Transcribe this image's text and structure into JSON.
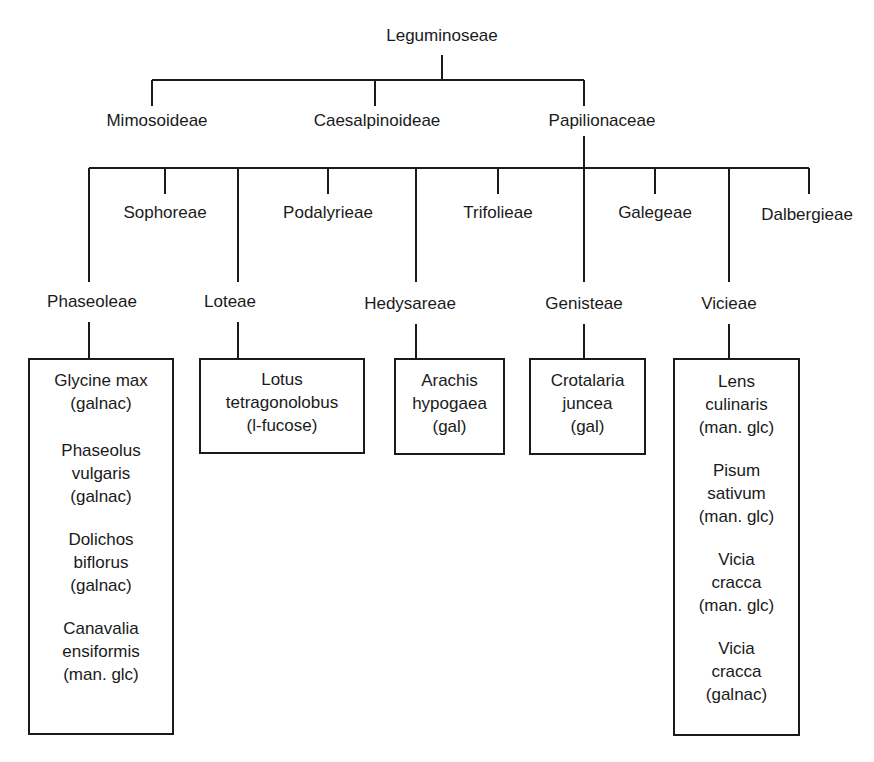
{
  "diagram": {
    "root": {
      "id": "leguminoseae",
      "label": "Leguminoseae"
    },
    "subfamilies": [
      {
        "id": "mimosoideae",
        "label": "Mimosoideae"
      },
      {
        "id": "caesalpinoideae",
        "label": "Caesalpinoideae"
      },
      {
        "id": "papilionaceae",
        "label": "Papilionaceae"
      }
    ],
    "tribes": [
      {
        "id": "phaseoleae",
        "label": "Phaseoleae",
        "row": "lower"
      },
      {
        "id": "sophoreae",
        "label": "Sophoreae",
        "row": "upper"
      },
      {
        "id": "loteae",
        "label": "Loteae",
        "row": "lower"
      },
      {
        "id": "podalyrieae",
        "label": "Podalyrieae",
        "row": "upper"
      },
      {
        "id": "hedysareae",
        "label": "Hedysareae",
        "row": "lower"
      },
      {
        "id": "trifolieae",
        "label": "Trifolieae",
        "row": "upper"
      },
      {
        "id": "genisteae",
        "label": "Genisteae",
        "row": "lower"
      },
      {
        "id": "galegeae",
        "label": "Galegeae",
        "row": "upper"
      },
      {
        "id": "vicieae",
        "label": "Vicieae",
        "row": "lower"
      },
      {
        "id": "dalbergieae",
        "label": "Dalbergieae",
        "row": "upper"
      }
    ],
    "species_boxes": [
      {
        "tribe": "phaseoleae",
        "species": [
          {
            "lines": [
              "Glycine max",
              "(galnac)"
            ]
          },
          {
            "lines": [
              "Phaseolus",
              "vulgaris",
              "(galnac)"
            ]
          },
          {
            "lines": [
              "Dolichos",
              "biflorus",
              "(galnac)"
            ]
          },
          {
            "lines": [
              "Canavalia",
              "ensiformis",
              "(man. glc)"
            ]
          }
        ]
      },
      {
        "tribe": "loteae",
        "species": [
          {
            "lines": [
              "Lotus",
              "tetragonolobus",
              "(l-fucose)"
            ]
          }
        ]
      },
      {
        "tribe": "hedysareae",
        "species": [
          {
            "lines": [
              "Arachis",
              "hypogaea",
              "(gal)"
            ]
          }
        ]
      },
      {
        "tribe": "genisteae",
        "species": [
          {
            "lines": [
              "Crotalaria",
              "juncea",
              "(gal)"
            ]
          }
        ]
      },
      {
        "tribe": "vicieae",
        "species": [
          {
            "lines": [
              "Lens",
              "culinaris",
              "(man. glc)"
            ]
          },
          {
            "lines": [
              "Pisum",
              "sativum",
              "(man. glc)"
            ]
          },
          {
            "lines": [
              "Vicia",
              "cracca",
              "(man. glc)"
            ]
          },
          {
            "lines": [
              "Vicia",
              "cracca",
              "(galnac)"
            ]
          }
        ]
      }
    ]
  }
}
